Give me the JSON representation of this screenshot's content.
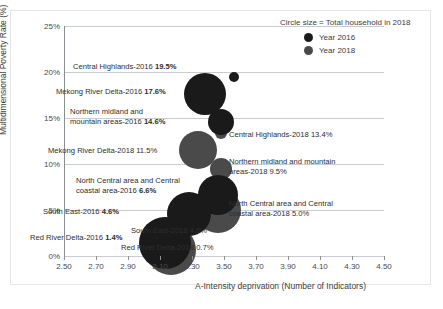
{
  "chart_data": {
    "type": "scatter",
    "title": "",
    "subtitle": "",
    "xlabel": "A-Intensity deprivation (Number of Indicators)",
    "ylabel": "Multidimensional Poverty Rate (%)",
    "xlim": [
      2.5,
      4.5
    ],
    "ylim": [
      0,
      25
    ],
    "xticks": [
      "2.50",
      "2.70",
      "2.90",
      "3.10",
      "3.30",
      "3.50",
      "3.70",
      "3.90",
      "4.10",
      "4.30",
      "4.50"
    ],
    "yticks": [
      "0%",
      "5%",
      "10%",
      "15%",
      "20%",
      "25%"
    ],
    "grid": "horizontal",
    "legend_position": "top-right",
    "size_encoding": "Circle size = Total household in 2018",
    "series": [
      {
        "name": "Year 2016",
        "color": "#1a1a1a",
        "points": [
          {
            "region": "Central Highlands",
            "year": 2016,
            "x": 3.56,
            "y": 19.5,
            "label": "Central Highlands-2016 19.5%",
            "size": 5
          },
          {
            "region": "Mekong River Delta",
            "year": 2016,
            "x": 3.38,
            "y": 17.6,
            "label": "Mekong River Delta-2016 17.6%",
            "size": 21
          },
          {
            "region": "Northern midland and mountain areas",
            "year": 2016,
            "x": 3.48,
            "y": 14.6,
            "label": "Northern midland and\nmountain areas-2016 14.6%",
            "size": 13
          },
          {
            "region": "North Central area and Central coastal area",
            "year": 2016,
            "x": 3.46,
            "y": 6.6,
            "label": "North Central area and Central\ncoastal area-2016 6.6%",
            "size": 20
          },
          {
            "region": "South East",
            "year": 2016,
            "x": 3.28,
            "y": 4.6,
            "label": "South East-2016 4.6%",
            "size": 22
          },
          {
            "region": "Red River Delta",
            "year": 2016,
            "x": 3.13,
            "y": 1.4,
            "label": "Red River Delta-2016 1.4%",
            "size": 26
          }
        ]
      },
      {
        "name": "Year 2018",
        "color": "#4a4a4a",
        "points": [
          {
            "region": "Central Highlands",
            "year": 2018,
            "x": 3.48,
            "y": 13.4,
            "label": "Central Highlands-2018 13.4%",
            "size": 6
          },
          {
            "region": "Mekong River Delta",
            "year": 2018,
            "x": 3.34,
            "y": 11.5,
            "label": "Mekong River Delta-2018 11.5%",
            "size": 19
          },
          {
            "region": "Northern midland and mountain areas",
            "year": 2018,
            "x": 3.48,
            "y": 9.5,
            "label": "Northern midland and mountain\nareas-2018 9.5%",
            "size": 11
          },
          {
            "region": "North Central area and Central coastal area",
            "year": 2018,
            "x": 3.46,
            "y": 5.0,
            "label": "North Central area and Central\ncoastal area-2018 5.0%",
            "size": 23
          },
          {
            "region": "South East",
            "year": 2018,
            "x": 3.32,
            "y": 4.6,
            "label": "South East-2018 4.6%",
            "size": 18
          },
          {
            "region": "Red River Delta",
            "year": 2018,
            "x": 3.17,
            "y": 0.7,
            "label": "Red River Delta-2018 0.7%",
            "size": 25
          }
        ]
      }
    ]
  },
  "legend": {
    "title": "Circle size = Total household in 2018",
    "entries": [
      {
        "label": "Year 2016",
        "color": "#1a1a1a"
      },
      {
        "label": "Year 2018",
        "color": "#4a4a4a"
      }
    ]
  },
  "axes": {
    "y_title": "Multidimensional Poverty Rate (%)",
    "x_title": "A-Intensity deprivation (Number of Indicators)",
    "y_ticks": [
      "25%",
      "20%",
      "15%",
      "10%",
      "5%",
      "0%"
    ],
    "x_ticks": [
      "2.50",
      "2.70",
      "2.90",
      "3.10",
      "3.30",
      "3.50",
      "3.70",
      "3.90",
      "4.10",
      "4.30",
      "4.50"
    ]
  },
  "annotations": [
    {
      "id": "central-highlands-2016",
      "text": "Central Highlands-2016 ",
      "bold": "19.5%"
    },
    {
      "id": "mekong-river-delta-2016",
      "text": "Mekong River Delta-2016 ",
      "bold": "17.6%"
    },
    {
      "id": "northern-midland-2016",
      "text": "Northern midland and\nmountain areas-2016 ",
      "bold": "14.6%"
    },
    {
      "id": "central-highlands-2018",
      "text": "Central Highlands-2018 13.4%",
      "bold": ""
    },
    {
      "id": "mekong-river-delta-2018",
      "text": "Mekong River Delta-2018 11.5%",
      "bold": ""
    },
    {
      "id": "northern-midland-2018",
      "text": "Northern midland and mountain\nareas-2018 9.5%",
      "bold": ""
    },
    {
      "id": "north-central-2016",
      "text": "North Central area and Central\ncoastal area-2016 ",
      "bold": "6.6%"
    },
    {
      "id": "south-east-2016",
      "text": "South East-2016 ",
      "bold": "4.6%"
    },
    {
      "id": "north-central-2018",
      "text": "North Central area and Central\ncoastal area-2018 5.0%",
      "bold": ""
    },
    {
      "id": "south-east-2018",
      "text": "South East-2018 4.6%",
      "bold": ""
    },
    {
      "id": "red-river-delta-2016",
      "text": "Red River Delta-2016 ",
      "bold": "1.4%"
    },
    {
      "id": "red-river-delta-2018",
      "text": "Red River Delta-2018 0.7%",
      "bold": ""
    }
  ]
}
